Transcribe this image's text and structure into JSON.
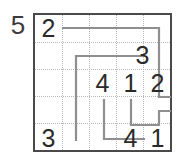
{
  "puzzle": {
    "kind": "numberlink-grid-puzzle",
    "size_label": "5",
    "grid_rows": 5,
    "grid_cols": 5,
    "colors": {
      "border": "#4a4a4a",
      "gridline": "#b9b9b9",
      "number": "#2a2a2a",
      "path": "#8f8f8f",
      "label": "#3b3b3b",
      "background": "#ffffff"
    },
    "clue_cells": [
      {
        "name": "clue-r1c1",
        "row": 1,
        "col": 1,
        "value": "2"
      },
      {
        "name": "clue-r2c4",
        "row": 2,
        "col": 4,
        "value": "3"
      },
      {
        "name": "clue-r3c2",
        "row": 3,
        "col": 2,
        "value": "4"
      },
      {
        "name": "clue-r3c3",
        "row": 3,
        "col": 3,
        "value": "1"
      },
      {
        "name": "clue-r3c4",
        "row": 4,
        "col": 4,
        "value": "2"
      },
      {
        "name": "clue-r5c1",
        "row": 5,
        "col": 1,
        "value": "3"
      },
      {
        "name": "clue-r5c4",
        "row": 5,
        "col": 4,
        "value": "4"
      },
      {
        "name": "clue-r5c5",
        "row": 5,
        "col": 5,
        "value": "1"
      }
    ],
    "values_flat": [
      "2",
      "3",
      "4",
      "1",
      "2",
      "3",
      "4",
      "1"
    ],
    "paths": [
      {
        "name": "path-2-to-2",
        "from": "2 (r1c1)",
        "to": "2 (r3c4)",
        "points": "27,13 124,13 124,82 138,82"
      },
      {
        "name": "path-3-to-3",
        "from": "3 (r2c4)",
        "to": "3 (r5c1)",
        "points": "110,41 41,41 41,124"
      },
      {
        "name": "path-4-to-4",
        "from": "4 (r3c2)",
        "to": "4 (r5c4)",
        "points": "69,82 69,124 110,124"
      },
      {
        "name": "path-1-to-1",
        "from": "1 (r3c3)",
        "to": "1 (r5c5)",
        "points": "96,82 96,110 124,110 124,96 138,96"
      }
    ]
  }
}
